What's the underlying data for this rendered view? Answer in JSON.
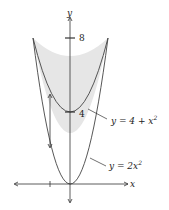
{
  "diagram": {
    "axes": {
      "x_label": "x",
      "y_label": "y"
    },
    "ticks": {
      "y_8": "8",
      "y_4": "4"
    },
    "curves": {
      "upper": {
        "label_prefix": "y = 4 + x",
        "exp": "2"
      },
      "lower": {
        "label_prefix": "y = 2x",
        "exp": "2"
      }
    },
    "colors": {
      "fill": "#e6e6e6",
      "stroke": "#444444"
    }
  }
}
